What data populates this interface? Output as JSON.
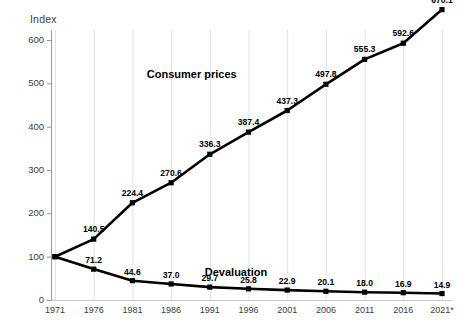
{
  "chart_data": {
    "type": "line",
    "title": "",
    "subtitle": "",
    "ylabel": "Index",
    "xlabel": "",
    "grid": "vertical",
    "legend_position": "inline-annotation",
    "xlim": [
      1971,
      2021
    ],
    "ylim": [
      0,
      670
    ],
    "yticks": [
      0,
      100,
      200,
      300,
      400,
      500,
      600
    ],
    "categories": [
      "1971",
      "1976",
      "1981",
      "1986",
      "1991",
      "1996",
      "2001",
      "2006",
      "2011",
      "2016",
      "2021*"
    ],
    "x": [
      1971,
      1976,
      1981,
      1986,
      1991,
      1996,
      2001,
      2006,
      2011,
      2016,
      2021
    ],
    "series": [
      {
        "name": "Consumer prices",
        "values": [
          100,
          140.5,
          224.4,
          270.6,
          336.3,
          387.4,
          437.3,
          497.8,
          555.3,
          592.6,
          670.1
        ],
        "labels": [
          "",
          "140.5",
          "224.4",
          "270.6",
          "336.3",
          "387.4",
          "437.3",
          "497.8",
          "555.3",
          "592.6",
          "670.1"
        ],
        "color": "#000000",
        "marker": "square"
      },
      {
        "name": "Devaluation",
        "values": [
          100,
          71.2,
          44.6,
          37.0,
          29.7,
          25.8,
          22.9,
          20.1,
          18.0,
          16.9,
          14.9
        ],
        "labels": [
          "",
          "71.2",
          "44.6",
          "37.0",
          "29.7",
          "25.8",
          "22.9",
          "20.1",
          "18.0",
          "16.9",
          "14.9"
        ],
        "color": "#000000",
        "marker": "square"
      }
    ],
    "annotations": [
      {
        "text": "Consumer prices",
        "x": 1991,
        "y": 520
      },
      {
        "text": "Devaluation",
        "x": 1990,
        "y": 62
      }
    ]
  },
  "axes": {
    "y_title": "Index",
    "y_ticks": [
      "600",
      "500",
      "400",
      "300",
      "200",
      "100",
      "0"
    ],
    "x_ticks": [
      "1971",
      "1976",
      "1981",
      "1986",
      "1991",
      "1996",
      "2001",
      "2006",
      "2011",
      "2016",
      "2021*"
    ]
  },
  "labels": {
    "consumer_prices": "Consumer prices",
    "devaluation": "Devaluation",
    "cp_points": [
      "140.5",
      "224.4",
      "270.6",
      "336.3",
      "387.4",
      "437.3",
      "497.8",
      "555.3",
      "592.6",
      "670.1"
    ],
    "dv_points": [
      "71.2",
      "44.6",
      "37.0",
      "29.7",
      "25.8",
      "22.9",
      "20.1",
      "18.0",
      "16.9",
      "14.9"
    ]
  },
  "colors": {
    "line": "#000000",
    "grid": "#e3e3e3",
    "axis": "#9a9a9a",
    "tick_text": "#3c3c3c"
  }
}
